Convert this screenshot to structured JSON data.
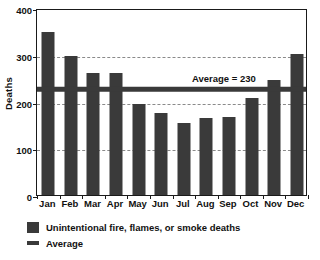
{
  "chart_data": {
    "type": "bar",
    "title": "",
    "xlabel": "",
    "ylabel": "Deaths",
    "ylim": [
      0,
      400
    ],
    "yticks": [
      0,
      100,
      200,
      300,
      400
    ],
    "ytick_labels": [
      "0",
      "100",
      "200",
      "300",
      "400"
    ],
    "grid": "horizontal-dashed",
    "categories": [
      "Jan",
      "Feb",
      "Mar",
      "Apr",
      "May",
      "Jun",
      "Jul",
      "Aug",
      "Sep",
      "Oct",
      "Nov",
      "Dec"
    ],
    "values": [
      349,
      298,
      261,
      261,
      195,
      175,
      154,
      164,
      167,
      208,
      246,
      302
    ],
    "series": [
      {
        "name": "Unintentional fire, flames, or smoke deaths",
        "values": [
          349,
          298,
          261,
          261,
          195,
          175,
          154,
          164,
          167,
          208,
          246,
          302
        ],
        "color": "#3a3a3a"
      }
    ],
    "reference_line": {
      "name": "Average",
      "value": 230,
      "annotation": "Average = 230",
      "color": "#3a3a3a"
    },
    "legend": {
      "position": "bottom-left",
      "entries": [
        {
          "label": "Unintentional fire, flames, or smoke deaths",
          "marker": "square",
          "color": "#3a3a3a"
        },
        {
          "label": "Average",
          "marker": "line",
          "color": "#3a3a3a"
        }
      ]
    },
    "colors": {
      "bar": "#3a3a3a",
      "average_line": "#3a3a3a",
      "axis": "#1a1a1a",
      "gridline": "#8a8a8a",
      "background": "#ffffff",
      "text": "#111111"
    }
  }
}
